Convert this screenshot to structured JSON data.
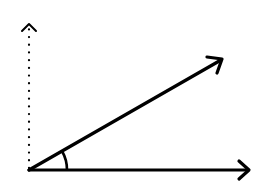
{
  "diagram": {
    "type": "angle-between-vectors",
    "stroke_color": "#000000",
    "background": "#ffffff",
    "origin": {
      "x": 29,
      "y": 170
    },
    "vertical_axis": {
      "style": "dotted",
      "end": {
        "x": 29,
        "y": 24
      },
      "arrowhead": "open-chevron"
    },
    "horizontal_vector": {
      "style": "solid",
      "end": {
        "x": 249,
        "y": 170
      },
      "arrowhead": "open-chevron"
    },
    "diagonal_vector": {
      "style": "solid",
      "end": {
        "x": 223,
        "y": 59
      },
      "arrowhead": "open-chevron"
    },
    "angle_arc": {
      "radius": 38,
      "between": [
        "horizontal_vector",
        "diagonal_vector"
      ]
    }
  }
}
